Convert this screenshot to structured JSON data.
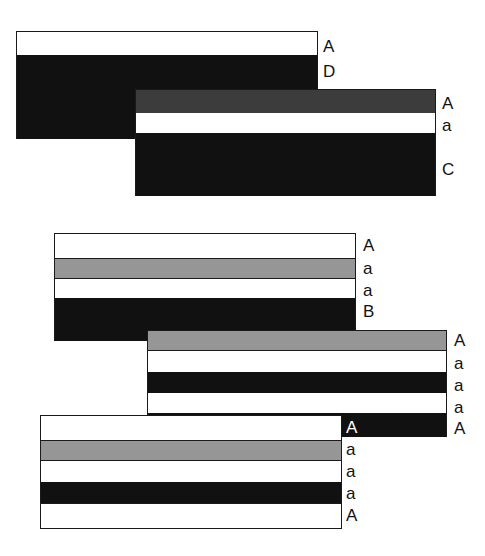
{
  "diagram": {
    "groups": [
      {
        "id": "group-1",
        "x": 16,
        "y": 31,
        "w": 302,
        "bands": [
          {
            "color": "white",
            "h": 24,
            "label": "A"
          },
          {
            "color": "black",
            "h": 84,
            "label": "D"
          }
        ]
      },
      {
        "id": "group-2",
        "x": 135,
        "y": 89,
        "w": 301,
        "bands": [
          {
            "color": "darkgray",
            "h": 24,
            "label": "A"
          },
          {
            "color": "white",
            "h": 20,
            "label": "a"
          },
          {
            "color": "black",
            "h": 62,
            "label": "C"
          }
        ]
      },
      {
        "id": "group-3",
        "x": 54,
        "y": 233,
        "w": 302,
        "bands": [
          {
            "color": "white",
            "h": 25,
            "label": "A"
          },
          {
            "color": "gray",
            "h": 21,
            "label": "a"
          },
          {
            "color": "white",
            "h": 19,
            "label": "a"
          },
          {
            "color": "black",
            "h": 43,
            "label": "B"
          }
        ]
      },
      {
        "id": "group-4",
        "x": 147,
        "y": 330,
        "w": 300,
        "bands": [
          {
            "color": "gray",
            "h": 21,
            "label": "A"
          },
          {
            "color": "white",
            "h": 21,
            "label": "a"
          },
          {
            "color": "black",
            "h": 21,
            "label": "a"
          },
          {
            "color": "white",
            "h": 20,
            "label": "a"
          },
          {
            "color": "black",
            "h": 23,
            "label": "A"
          }
        ]
      },
      {
        "id": "group-5",
        "x": 40,
        "y": 415,
        "w": 302,
        "bands": [
          {
            "color": "white",
            "h": 25,
            "label": "A"
          },
          {
            "color": "gray",
            "h": 21,
            "label": "a"
          },
          {
            "color": "white",
            "h": 21,
            "label": "a"
          },
          {
            "color": "black",
            "h": 21,
            "label": "a"
          },
          {
            "color": "white",
            "h": 25,
            "label": "A"
          }
        ]
      }
    ],
    "labels": {
      "g1": [
        "A",
        "D"
      ],
      "g2": [
        "A",
        "a",
        "C"
      ],
      "g3": [
        "A",
        "a",
        "a",
        "B"
      ],
      "g4": [
        "A",
        "a",
        "a",
        "a",
        "A"
      ],
      "g5": [
        "A",
        "a",
        "a",
        "a",
        "A"
      ]
    },
    "colors": {
      "white": "#ffffff",
      "black": "#111111",
      "gray": "#969696",
      "darkgray": "#3c3c3c"
    }
  }
}
